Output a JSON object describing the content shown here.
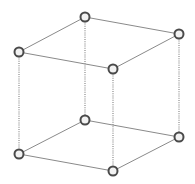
{
  "diagram": {
    "type": "wireframe-cube",
    "colors": {
      "background": "#ffffff",
      "edge": "#8a8a8a",
      "vertex_stroke": "#4a4a4a",
      "vertex_fill": "#f2f2f2"
    },
    "vertex_radius": 4.5,
    "vertices": [
      {
        "id": "top-back",
        "x": 85,
        "y": 17
      },
      {
        "id": "top-left",
        "x": 19,
        "y": 52
      },
      {
        "id": "top-right",
        "x": 179,
        "y": 34
      },
      {
        "id": "top-front",
        "x": 113,
        "y": 69
      },
      {
        "id": "bottom-back",
        "x": 85,
        "y": 120
      },
      {
        "id": "bottom-left",
        "x": 19,
        "y": 154
      },
      {
        "id": "bottom-right",
        "x": 179,
        "y": 137
      },
      {
        "id": "bottom-front",
        "x": 113,
        "y": 171
      }
    ],
    "edges": [
      {
        "from": 0,
        "to": 1,
        "style": "solid"
      },
      {
        "from": 0,
        "to": 2,
        "style": "solid"
      },
      {
        "from": 1,
        "to": 3,
        "style": "solid"
      },
      {
        "from": 2,
        "to": 3,
        "style": "solid"
      },
      {
        "from": 4,
        "to": 5,
        "style": "solid"
      },
      {
        "from": 4,
        "to": 6,
        "style": "solid"
      },
      {
        "from": 5,
        "to": 7,
        "style": "solid"
      },
      {
        "from": 6,
        "to": 7,
        "style": "solid"
      },
      {
        "from": 0,
        "to": 4,
        "style": "dotted"
      },
      {
        "from": 1,
        "to": 5,
        "style": "dotted"
      },
      {
        "from": 2,
        "to": 6,
        "style": "dotted"
      },
      {
        "from": 3,
        "to": 7,
        "style": "dotted"
      }
    ]
  }
}
